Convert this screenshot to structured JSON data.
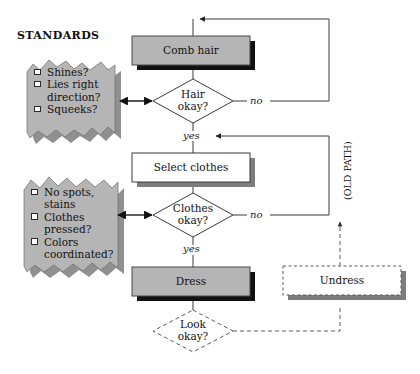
{
  "diagram": {
    "heading": "STANDARDS",
    "colors": {
      "process_fill": "#b5b5b5",
      "process_fill_white": "#ffffff",
      "note_fill": "#b5b5b5",
      "shadow_dark": "#111111",
      "shadow_gray": "#7d7d7d",
      "line": "#3b3b3b",
      "dashed_line": "#5a5a5a"
    }
  },
  "nodes": {
    "comb_hair": {
      "label": "Comb hair",
      "shape": "process",
      "fill": "gray",
      "shadow": "dark"
    },
    "hair_okay": {
      "label_line1": "Hair",
      "label_line2": "okay?",
      "shape": "decision",
      "fill": "white"
    },
    "select_clothes": {
      "label": "Select clothes",
      "shape": "process",
      "fill": "white",
      "shadow": "gray"
    },
    "clothes_okay": {
      "label_line1": "Clothes",
      "label_line2": "okay?",
      "shape": "decision",
      "fill": "white"
    },
    "dress": {
      "label": "Dress",
      "shape": "process",
      "fill": "gray",
      "shadow": "dark"
    },
    "look_okay": {
      "label_line1": "Look",
      "label_line2": "okay?",
      "shape": "decision",
      "fill": "white",
      "border": "dashed"
    },
    "undress": {
      "label": "Undress",
      "shape": "process",
      "fill": "white",
      "border": "dashed",
      "shadow": "gray"
    }
  },
  "edge_labels": {
    "hair_no": "no",
    "hair_yes": "yes",
    "clothes_no": "no",
    "clothes_yes": "yes",
    "old_path": "(OLD PATH)"
  },
  "notes": [
    {
      "id": "hair-standards-note",
      "items": [
        {
          "checkbox": true,
          "lines": [
            "Shines?"
          ]
        },
        {
          "checkbox": true,
          "lines": [
            "Lies right",
            "direction?"
          ]
        },
        {
          "checkbox": true,
          "lines": [
            "Squeeks?"
          ]
        }
      ]
    },
    {
      "id": "clothes-standards-note",
      "items": [
        {
          "checkbox": true,
          "lines": [
            "No spots,",
            "stains"
          ]
        },
        {
          "checkbox": true,
          "lines": [
            "Clothes",
            "pressed?"
          ]
        },
        {
          "checkbox": true,
          "lines": [
            "Colors",
            "coordinated?"
          ]
        }
      ]
    }
  ],
  "note_text": {
    "note1": {
      "l1": "Shines?",
      "l2": "Lies right",
      "l3": "direction?",
      "l4": "Squeeks?"
    },
    "note2": {
      "l1": "No spots,",
      "l2": "stains",
      "l3": "Clothes",
      "l4": "pressed?",
      "l5": "Colors",
      "l6": "coordinated?"
    }
  }
}
